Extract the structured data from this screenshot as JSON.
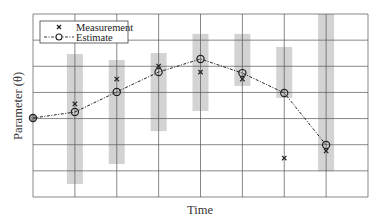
{
  "chart_data": {
    "type": "line",
    "title": "",
    "xlabel": "Time",
    "ylabel": "Parameter (θ)",
    "xlim": [
      0,
      8
    ],
    "ylim": [
      0,
      7
    ],
    "grid": true,
    "x_ticks_count": 9,
    "y_ticks_count": 8,
    "tick_labels_visible": false,
    "legend": {
      "position": "upper left",
      "entries": [
        {
          "label": "Measurement",
          "marker": "x",
          "line": "none"
        },
        {
          "label": "Estimate",
          "marker": "o",
          "line": "dash-dot"
        }
      ]
    },
    "series": [
      {
        "name": "Estimate",
        "x": [
          0,
          1,
          2,
          3,
          4,
          5,
          6,
          7
        ],
        "values": [
          3.02,
          3.25,
          4.02,
          4.78,
          5.28,
          4.74,
          3.98,
          1.99
        ]
      },
      {
        "name": "Measurement",
        "x": [
          1,
          2,
          3,
          4,
          5,
          6,
          7
        ],
        "values": [
          3.56,
          4.51,
          5.01,
          4.78,
          4.51,
          1.49,
          1.76
        ]
      }
    ],
    "uncertainty_bands": {
      "x": [
        1,
        2,
        3,
        4,
        5,
        6,
        7
      ],
      "lower": [
        0.5,
        1.26,
        2.52,
        3.29,
        4.25,
        3.79,
        0.99
      ],
      "upper": [
        5.47,
        5.24,
        5.51,
        6.24,
        6.24,
        5.74,
        7.0
      ],
      "color": "#d3d3d3"
    },
    "colors": {
      "grid": "#555555",
      "band": "#d3d3d3",
      "line": "#222222",
      "background": "#ffffff"
    }
  }
}
